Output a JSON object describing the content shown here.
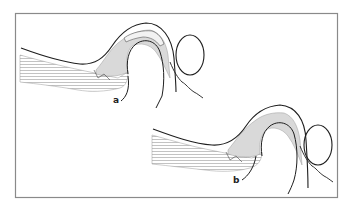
{
  "figure": {
    "type": "anatomical-line-drawing",
    "panels": [
      {
        "id": "a",
        "label": "a"
      },
      {
        "id": "b",
        "label": "b"
      }
    ]
  },
  "colors": {
    "border": "#8a8a8a",
    "outline": "#1e1e1e",
    "tissue_fill": "#d9d9d9",
    "hatch": "#9a9a9a",
    "background": "#ffffff"
  }
}
